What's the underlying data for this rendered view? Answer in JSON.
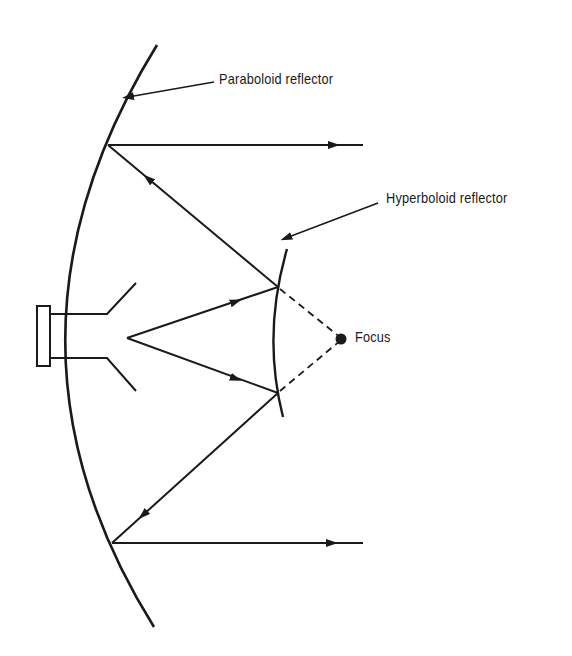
{
  "figure": {
    "labels": {
      "paraboloid": "Paraboloid reflector",
      "hyperboloid": "Hyperboloid reflector",
      "focus": "Focus"
    },
    "components": [
      {
        "id": "paraboloid",
        "name": "Paraboloid reflector",
        "shape": "parabolic arc (main reflector)"
      },
      {
        "id": "hyperboloid",
        "name": "Hyperboloid reflector",
        "shape": "hyperbolic arc (subreflector)"
      },
      {
        "id": "feed",
        "name": "Feed horn",
        "shape": "rectangular flange with flared horn"
      },
      {
        "id": "focus",
        "name": "Focus",
        "shape": "filled dot"
      }
    ],
    "rays": [
      {
        "from": "feed",
        "to": "hyperboloid",
        "style": "solid",
        "direction": "forward"
      },
      {
        "from": "hyperboloid",
        "to": "paraboloid",
        "style": "solid",
        "direction": "forward"
      },
      {
        "from": "paraboloid",
        "to": "outgoing",
        "style": "solid",
        "direction": "forward"
      },
      {
        "from": "hyperboloid",
        "to": "focus",
        "style": "dashed",
        "direction": "virtual"
      }
    ],
    "colors": {
      "ink": "#1a1a1a",
      "background": "#ffffff"
    }
  }
}
